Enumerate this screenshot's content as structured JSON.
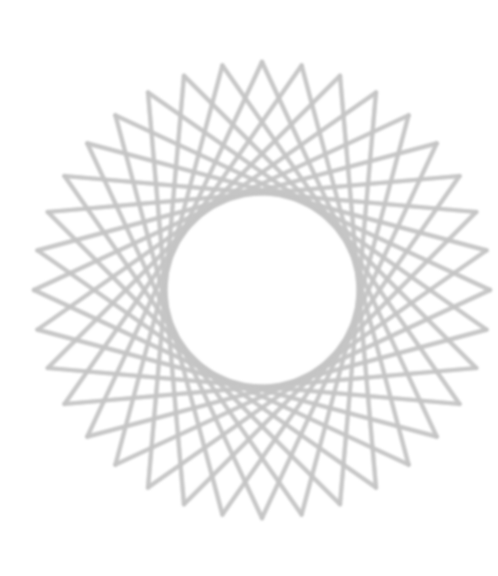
{
  "artwork": {
    "type": "string-art-rosette",
    "background": "#ffffff",
    "stroke_color": "#c4c4c4",
    "stroke_width": 4.2,
    "stroke_opacity": 0.75,
    "center": [
      262,
      290
    ],
    "radius": 228,
    "points": 36,
    "chord_step": 13,
    "rotation_deg": -90
  }
}
